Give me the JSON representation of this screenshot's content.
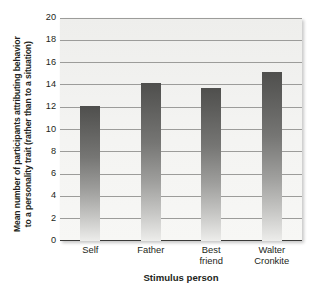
{
  "chart_data": {
    "type": "bar",
    "title": "",
    "categories": [
      "Self",
      "Father",
      "Best friend",
      "Walter Cronkite"
    ],
    "category_lines": [
      [
        "Self"
      ],
      [
        "Father"
      ],
      [
        "Best",
        "friend"
      ],
      [
        "Walter",
        "Cronkite"
      ]
    ],
    "values": [
      12.1,
      14.2,
      13.7,
      15.2
    ],
    "xlabel": "Stimulus person",
    "ylabel": "Mean number of participants attributing behavior to a personality trait (rather than to a situation)",
    "ylabel_lines": [
      "Mean number of participants attributing behavior",
      "to a personality trait (rather than to a situation)"
    ],
    "ylim": [
      0,
      20
    ],
    "ytick_step": 2,
    "yticks": [
      20,
      18,
      16,
      14,
      12,
      10,
      8,
      6,
      4,
      2,
      0
    ],
    "grid": true,
    "legend": null,
    "legend_position": "none",
    "bar_color_top": "#4f4f4d",
    "bar_color_bottom": "#ededeb",
    "plot_background": "#f2f2f0",
    "gridline_color": "#9c9c9a",
    "axis_color": "#3a3a38",
    "text_color": "#231f20"
  }
}
